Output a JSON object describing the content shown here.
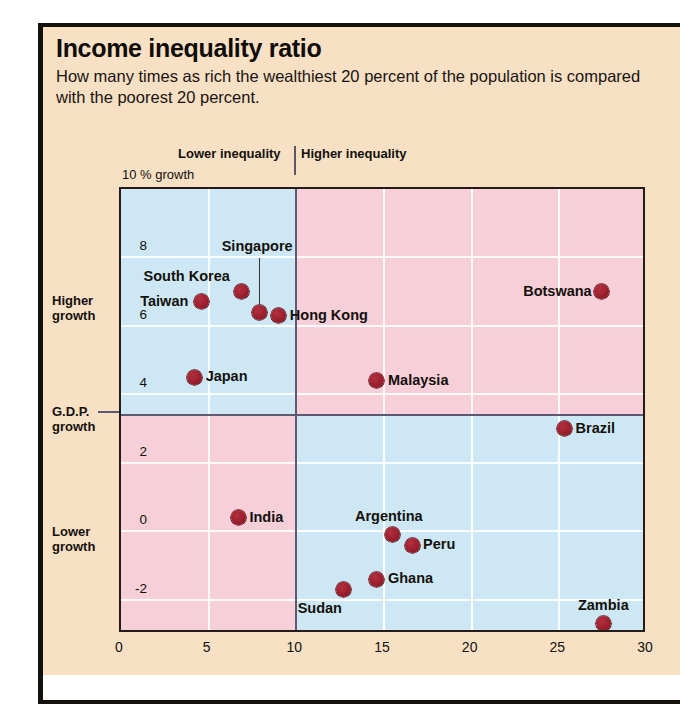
{
  "header": {
    "title": "Income inequality ratio",
    "subtitle": "How many times as rich the wealthiest 20 percent of the population is compared with the poorest 20 percent."
  },
  "annotations": {
    "lower_inequality": "Lower inequality",
    "higher_inequality": "Higher inequality",
    "growth_unit": "10 % growth",
    "higher_growth": "Higher\ngrowth",
    "higher_growth_line1": "Higher",
    "higher_growth_line2": "growth",
    "gdp_growth_line1": "G.D.P.",
    "gdp_growth_line2": "growth",
    "lower_growth_line1": "Lower",
    "lower_growth_line2": "growth"
  },
  "colors": {
    "card_background": "#f7e0c4",
    "blue_quadrant": "#cde8f4",
    "pink_quadrant": "#f6cfd8",
    "marker": "#a0212f",
    "divider": "#5e5870",
    "gridline": "#ffffff",
    "text": "#14100c"
  },
  "chart_data": {
    "type": "scatter",
    "title": "Income inequality ratio",
    "subtitle": "How many times as rich the wealthiest 20 percent of the population is compared with the poorest 20 percent.",
    "xlabel": "Income inequality ratio (richest 20% / poorest 20%)",
    "ylabel": "G.D.P. growth (% per year)",
    "xlim": [
      0,
      30
    ],
    "ylim": [
      -3,
      10
    ],
    "xticks": [
      0,
      5,
      10,
      15,
      20,
      25,
      30
    ],
    "yticks": [
      8,
      6,
      4,
      2,
      0,
      -2
    ],
    "grid": true,
    "legend": "none",
    "quadrant_split_x": 10,
    "quadrant_split_y": 3.4,
    "points": [
      {
        "label": "Taiwan",
        "x": 4.6,
        "y": 6.7,
        "label_pos": "left"
      },
      {
        "label": "South Korea",
        "x": 6.9,
        "y": 7.0,
        "label_pos": "above-left"
      },
      {
        "label": "Singapore",
        "x": 7.9,
        "y": 6.4,
        "label_pos": "leader-above"
      },
      {
        "label": "Hong Kong",
        "x": 9.0,
        "y": 6.3,
        "label_pos": "right"
      },
      {
        "label": "Japan",
        "x": 4.2,
        "y": 4.5,
        "label_pos": "right"
      },
      {
        "label": "Malaysia",
        "x": 14.6,
        "y": 4.4,
        "label_pos": "right"
      },
      {
        "label": "Botswana",
        "x": 27.4,
        "y": 7.0,
        "label_pos": "left"
      },
      {
        "label": "Brazil",
        "x": 25.3,
        "y": 3.0,
        "label_pos": "right"
      },
      {
        "label": "India",
        "x": 6.7,
        "y": 0.4,
        "label_pos": "right"
      },
      {
        "label": "Argentina",
        "x": 15.5,
        "y": -0.1,
        "label_pos": "above"
      },
      {
        "label": "Peru",
        "x": 16.6,
        "y": -0.4,
        "label_pos": "right"
      },
      {
        "label": "Ghana",
        "x": 14.6,
        "y": -1.4,
        "label_pos": "right"
      },
      {
        "label": "Sudan",
        "x": 12.7,
        "y": -1.7,
        "label_pos": "below-left"
      },
      {
        "label": "Zambia",
        "x": 27.5,
        "y": -2.7,
        "label_pos": "above"
      }
    ]
  }
}
